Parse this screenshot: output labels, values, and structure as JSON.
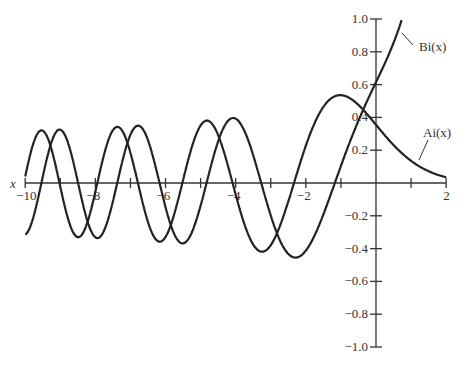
{
  "chart_data": {
    "type": "line",
    "title": "",
    "xlabel": "x",
    "ylabel": "",
    "xlim": [
      -10,
      2
    ],
    "ylim": [
      -1.0,
      1.0
    ],
    "grid": false,
    "x_ticks": [
      -10,
      -9,
      -8,
      -7,
      -6,
      -5,
      -4,
      -3,
      -2,
      -1,
      0,
      1,
      2
    ],
    "x_tick_labels": [
      "−10",
      "−8",
      "−6",
      "−4",
      "−2",
      "2"
    ],
    "x_tick_label_values": [
      -10,
      -8,
      -6,
      -4,
      -2,
      2
    ],
    "y_ticks": [
      -1.0,
      -0.8,
      -0.6,
      -0.4,
      -0.2,
      0.2,
      0.4,
      0.6,
      0.8,
      1.0
    ],
    "y_tick_labels": [
      "−1.0",
      "−0.8",
      "−0.6",
      "−0.4",
      "−0.2",
      "0.2",
      "0.4",
      "0.6",
      "0.8",
      "1.0"
    ],
    "x": [
      -10,
      -9,
      -8,
      -7,
      -6,
      -5,
      -4,
      -3,
      -2,
      -1,
      0,
      1,
      2
    ],
    "series": [
      {
        "name": "Ai(x)",
        "label": "Ai(x)",
        "values": [
          0.0424,
          -0.0221,
          0.0531,
          0.1842,
          -0.3292,
          0.3508,
          -0.0702,
          -0.3788,
          0.2274,
          0.5356,
          0.355,
          0.1353,
          0.0349
        ],
        "x0": 0,
        "y0": 0.355028,
        "dy0": -0.258819
      },
      {
        "name": "Bi(x)",
        "label": "Bi(x)",
        "values": [
          -0.3147,
          0.2221,
          -0.3312,
          0.2936,
          -0.1465,
          -0.1383,
          0.3922,
          -0.1983,
          -0.4123,
          0.104,
          0.6149,
          1.2074,
          3.2981
        ],
        "x0": 0,
        "y0": 0.614927,
        "dy0": 0.448288
      }
    ],
    "annotations": [
      {
        "text": "Bi(x)",
        "points_to_x": 0.9
      },
      {
        "text": "Ai(x)",
        "points_to_x": 1.2
      }
    ]
  },
  "labels": {
    "x_axis": "x",
    "bi": "Bi(x)",
    "ai": "Ai(x)"
  }
}
